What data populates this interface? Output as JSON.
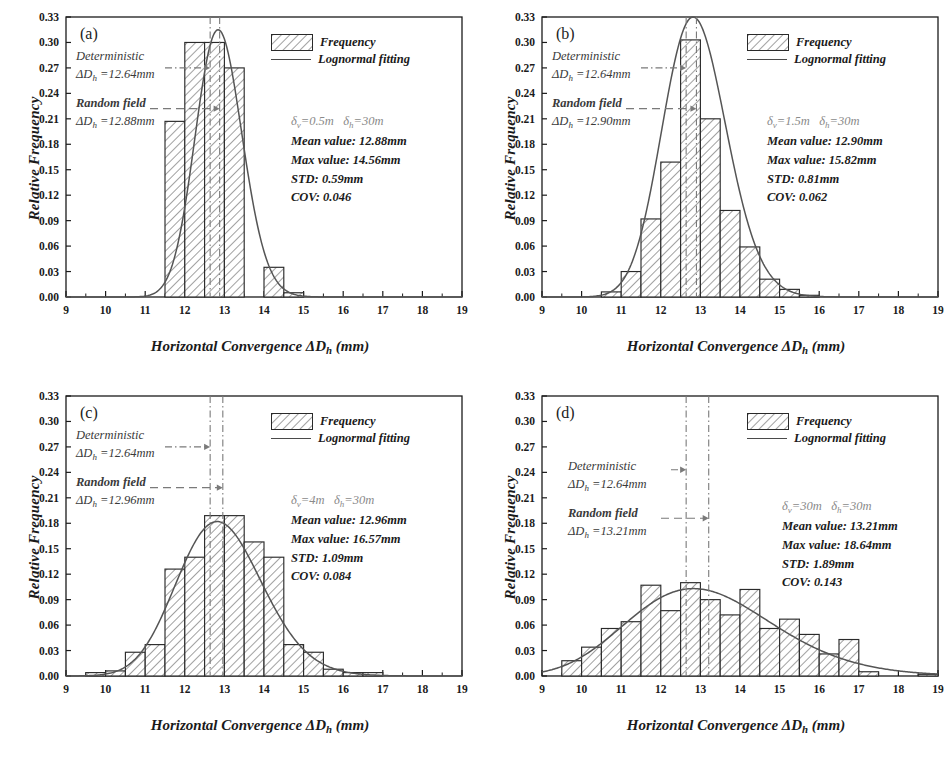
{
  "figure": {
    "axis": {
      "xlabel_main": "Horizontal Convergence ",
      "xlabel_sym": "ΔD",
      "xlabel_sub": "h",
      "xlabel_unit": " (mm)",
      "ylabel": "Relative Frequency",
      "xlim": [
        9,
        19
      ],
      "ylim": [
        0.0,
        0.33
      ],
      "xticks": [
        "9",
        "10",
        "11",
        "12",
        "13",
        "14",
        "15",
        "16",
        "17",
        "18",
        "19"
      ],
      "yticks": [
        "0.00",
        "0.03",
        "0.06",
        "0.09",
        "0.12",
        "0.15",
        "0.18",
        "0.21",
        "0.24",
        "0.27",
        "0.30",
        "0.33"
      ]
    },
    "legend": {
      "frequency_label": "Frequency",
      "fitting_label": "Lognormal fitting"
    },
    "annotations": {
      "deterministic_label": "Deterministic",
      "deterministic_sym": "ΔD",
      "deterministic_sub": "h",
      "random_label": "Random field",
      "random_sym": "ΔD",
      "random_sub": "h"
    },
    "colors": {
      "axis": "#1b1b1b",
      "bar_edge": "#2a2a2a",
      "hatch": "#6e6e6e",
      "curve": "#555555",
      "guide": "#7a7a7a",
      "stats_corr": "#8a8a8a"
    }
  },
  "chart_data": [
    {
      "type": "bar",
      "panel": "(a)",
      "title": "",
      "xlabel": "Horizontal Convergence ΔDh (mm)",
      "ylabel": "Relative Frequency",
      "xlim": [
        9,
        19
      ],
      "ylim": [
        0.0,
        0.33
      ],
      "grid": false,
      "legend_position": "top-right",
      "bin_width": 0.5,
      "bin_starts": [
        9.5,
        10.0,
        10.5,
        11.0,
        11.5,
        12.0,
        12.5,
        13.0,
        13.5,
        14.0,
        14.5,
        15.0,
        15.5
      ],
      "values": [
        0.0,
        0.0,
        0.0,
        0.002,
        0.207,
        0.3,
        0.3,
        0.27,
        0.27,
        0.035,
        0.035,
        0.002,
        0.0
      ],
      "bars": [
        {
          "x0": 11.5,
          "x1": 12.0,
          "h": 0.207
        },
        {
          "x0": 12.0,
          "x1": 12.5,
          "h": 0.3
        },
        {
          "x0": 12.5,
          "x1": 13.0,
          "h": 0.3
        },
        {
          "x0": 13.0,
          "x1": 13.5,
          "h": 0.27
        },
        {
          "x0": 14.0,
          "x1": 14.5,
          "h": 0.035
        },
        {
          "x0": 14.5,
          "x1": 15.0,
          "h": 0.005
        }
      ],
      "fit_curve": {
        "name": "Lognormal fitting",
        "mu_ln": 2.5548,
        "sigma_ln": 0.0459,
        "peak": 0.315
      },
      "deterministic_line": 12.64,
      "random_field_line": 12.88,
      "annotation_det": "ΔDh =12.64mm",
      "annotation_rf": "ΔDh =12.88mm",
      "stats": {
        "correlation": "δv=0.5m    δh=30m",
        "delta_v": "0.5m",
        "delta_h": "30m",
        "mean": "Mean value: 12.88mm",
        "max": "Max value: 14.56mm",
        "std": "STD: 0.59mm",
        "cov": "COV: 0.046"
      }
    },
    {
      "type": "bar",
      "panel": "(b)",
      "title": "",
      "xlabel": "Horizontal Convergence ΔDh (mm)",
      "ylabel": "Relative Frequency",
      "xlim": [
        9,
        19
      ],
      "ylim": [
        0.0,
        0.33
      ],
      "grid": false,
      "legend_position": "top-right",
      "bin_width": 0.5,
      "bars": [
        {
          "x0": 10.5,
          "x1": 11.0,
          "h": 0.006
        },
        {
          "x0": 11.0,
          "x1": 11.5,
          "h": 0.03
        },
        {
          "x0": 11.5,
          "x1": 12.0,
          "h": 0.092
        },
        {
          "x0": 12.0,
          "x1": 12.5,
          "h": 0.159
        },
        {
          "x0": 12.5,
          "x1": 13.0,
          "h": 0.303
        },
        {
          "x0": 13.0,
          "x1": 13.5,
          "h": 0.21
        },
        {
          "x0": 13.5,
          "x1": 14.0,
          "h": 0.102
        },
        {
          "x0": 14.0,
          "x1": 14.5,
          "h": 0.059
        },
        {
          "x0": 14.5,
          "x1": 15.0,
          "h": 0.021
        },
        {
          "x0": 15.0,
          "x1": 15.5,
          "h": 0.009
        },
        {
          "x0": 15.5,
          "x1": 16.0,
          "h": 0.002
        }
      ],
      "fit_curve": {
        "name": "Lognormal fitting",
        "mu_ln": 2.5546,
        "sigma_ln": 0.0628,
        "peak": 0.33
      },
      "deterministic_line": 12.64,
      "random_field_line": 12.9,
      "annotation_det": "ΔDh =12.64mm",
      "annotation_rf": "ΔDh =12.90mm",
      "stats": {
        "correlation": "δv=1.5m    δh=30m",
        "delta_v": "1.5m",
        "delta_h": "30m",
        "mean": "Mean value: 12.90mm",
        "max": "Max value: 15.82mm",
        "std": "STD: 0.81mm",
        "cov": "COV: 0.062"
      }
    },
    {
      "type": "bar",
      "panel": "(c)",
      "title": "",
      "xlabel": "Horizontal Convergence ΔDh (mm)",
      "ylabel": "Relative Frequency",
      "xlim": [
        9,
        19
      ],
      "ylim": [
        0.0,
        0.33
      ],
      "grid": false,
      "legend_position": "top-right",
      "bin_width": 0.5,
      "bars": [
        {
          "x0": 9.5,
          "x1": 10.0,
          "h": 0.004
        },
        {
          "x0": 10.0,
          "x1": 10.5,
          "h": 0.006
        },
        {
          "x0": 10.5,
          "x1": 11.0,
          "h": 0.028
        },
        {
          "x0": 11.0,
          "x1": 11.5,
          "h": 0.037
        },
        {
          "x0": 11.5,
          "x1": 12.0,
          "h": 0.126
        },
        {
          "x0": 12.0,
          "x1": 12.5,
          "h": 0.14
        },
        {
          "x0": 12.5,
          "x1": 13.0,
          "h": 0.189
        },
        {
          "x0": 13.0,
          "x1": 13.5,
          "h": 0.189
        },
        {
          "x0": 13.5,
          "x1": 14.0,
          "h": 0.158
        },
        {
          "x0": 14.0,
          "x1": 14.5,
          "h": 0.14
        },
        {
          "x0": 14.5,
          "x1": 15.0,
          "h": 0.037
        },
        {
          "x0": 15.0,
          "x1": 15.5,
          "h": 0.028
        },
        {
          "x0": 15.5,
          "x1": 16.0,
          "h": 0.008
        },
        {
          "x0": 16.0,
          "x1": 16.5,
          "h": 0.004
        },
        {
          "x0": 16.5,
          "x1": 17.0,
          "h": 0.004
        }
      ],
      "fit_curve": {
        "name": "Lognormal fitting",
        "mu_ln": 2.5578,
        "sigma_ln": 0.0838,
        "peak": 0.182
      },
      "deterministic_line": 12.64,
      "random_field_line": 12.96,
      "annotation_det": "ΔDh =12.64mm",
      "annotation_rf": "ΔDh =12.96mm",
      "stats": {
        "correlation": "δv=4m    δh=30m",
        "delta_v": "4m",
        "delta_h": "30m",
        "mean": "Mean value: 12.96mm",
        "max": "Max value: 16.57mm",
        "std": "STD: 1.09mm",
        "cov": "COV: 0.084"
      }
    },
    {
      "type": "bar",
      "panel": "(d)",
      "title": "",
      "xlabel": "Horizontal Convergence ΔDh (mm)",
      "ylabel": "Relative Frequency",
      "xlim": [
        9,
        19
      ],
      "ylim": [
        0.0,
        0.33
      ],
      "grid": false,
      "legend_position": "top-right",
      "bin_width": 0.5,
      "bars": [
        {
          "x0": 9.5,
          "x1": 10.0,
          "h": 0.018
        },
        {
          "x0": 10.0,
          "x1": 10.5,
          "h": 0.034
        },
        {
          "x0": 10.5,
          "x1": 11.0,
          "h": 0.056
        },
        {
          "x0": 11.0,
          "x1": 11.5,
          "h": 0.064
        },
        {
          "x0": 11.5,
          "x1": 12.0,
          "h": 0.107
        },
        {
          "x0": 12.0,
          "x1": 12.5,
          "h": 0.077
        },
        {
          "x0": 12.5,
          "x1": 13.0,
          "h": 0.11
        },
        {
          "x0": 13.0,
          "x1": 13.5,
          "h": 0.09
        },
        {
          "x0": 13.5,
          "x1": 14.0,
          "h": 0.072
        },
        {
          "x0": 14.0,
          "x1": 14.5,
          "h": 0.102
        },
        {
          "x0": 14.5,
          "x1": 15.0,
          "h": 0.056
        },
        {
          "x0": 15.0,
          "x1": 15.5,
          "h": 0.067
        },
        {
          "x0": 15.5,
          "x1": 16.0,
          "h": 0.049
        },
        {
          "x0": 16.0,
          "x1": 16.5,
          "h": 0.026
        },
        {
          "x0": 16.5,
          "x1": 17.0,
          "h": 0.043
        },
        {
          "x0": 17.0,
          "x1": 17.5,
          "h": 0.005
        },
        {
          "x0": 18.5,
          "x1": 19.0,
          "h": 0.002
        }
      ],
      "fit_curve": {
        "name": "Lognormal fitting",
        "mu_ln": 2.5715,
        "sigma_ln": 0.1425,
        "peak": 0.103
      },
      "deterministic_line": 12.64,
      "random_field_line": 13.21,
      "annotation_det": "ΔDh =12.64mm",
      "annotation_rf": "ΔDh =13.21mm",
      "stats": {
        "correlation": "δv=30m    δh=30m",
        "delta_v": "30m",
        "delta_h": "30m",
        "mean": "Mean value: 13.21mm",
        "max": "Max value: 18.64mm",
        "std": "STD: 1.89mm",
        "cov": "COV: 0.143"
      }
    }
  ]
}
